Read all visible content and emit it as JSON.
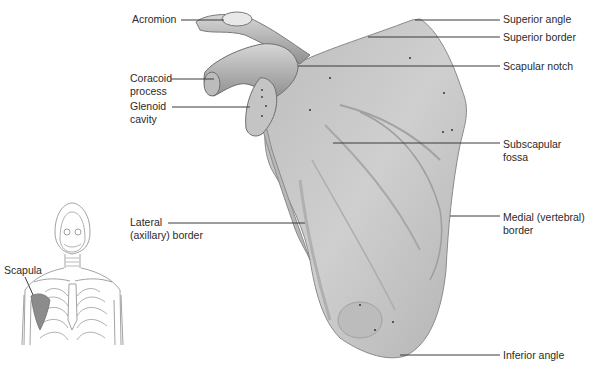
{
  "diagram": {
    "colors": {
      "bone": "#c9c9c9",
      "bone_shadow": "#9a9a9a",
      "leader": "#3a3a3a",
      "text": "#2a2a2a",
      "inset_highlight": "#8c8c8c"
    }
  },
  "labels": {
    "acromion": "Acromion",
    "coracoid_1": "Coracoid",
    "coracoid_2": "process",
    "glenoid_1": "Glenoid",
    "glenoid_2": "cavity",
    "lateral_1": "Lateral",
    "lateral_2": "(axillary) border",
    "superior_angle": "Superior angle",
    "superior_border": "Superior border",
    "scapular_notch": "Scapular notch",
    "subscapular_1": "Subscapular",
    "subscapular_2": "fossa",
    "medial_1": "Medial (vertebral)",
    "medial_2": "border",
    "inferior_angle": "Inferior angle",
    "inset_scapula": "Scapula"
  }
}
